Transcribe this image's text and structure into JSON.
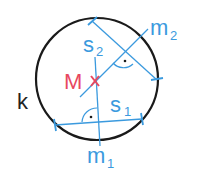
{
  "diagram": {
    "colors": {
      "circle": "#1a1a1a",
      "construction": "#3b9ade",
      "center": "#e8485f",
      "label_dark": "#222222"
    },
    "labels": {
      "circle": "k",
      "center": "M",
      "chord1": "s",
      "chord1_sub": "1",
      "chord2": "s",
      "chord2_sub": "2",
      "bisector1": "m",
      "bisector1_sub": "1",
      "bisector2": "m",
      "bisector2_sub": "2"
    },
    "markers": {
      "center_mark": "cross",
      "right_angle_dot": "·"
    }
  }
}
